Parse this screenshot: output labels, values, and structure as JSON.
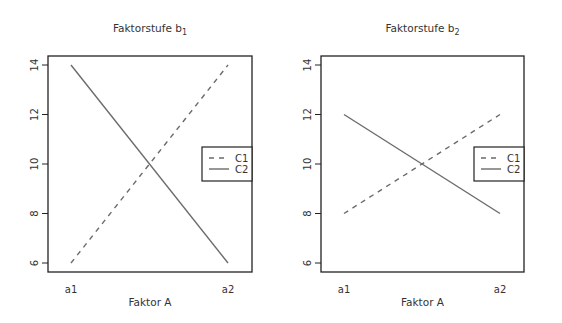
{
  "chart_data": [
    {
      "type": "line",
      "title": "Faktorstufe b",
      "title_subscript": "1",
      "xlabel": "Faktor A",
      "ylabel": "",
      "categories": [
        "a1",
        "a2"
      ],
      "series": [
        {
          "name": "C1",
          "values": [
            6,
            14
          ],
          "style": "dashed"
        },
        {
          "name": "C2",
          "values": [
            14,
            6
          ],
          "style": "solid"
        }
      ],
      "yticks": [
        "6",
        "8",
        "10",
        "12",
        "14"
      ],
      "ylim": [
        6,
        14
      ],
      "grid": false,
      "legend_position": "right"
    },
    {
      "type": "line",
      "title": "Faktorstufe b",
      "title_subscript": "2",
      "xlabel": "Faktor A",
      "ylabel": "",
      "categories": [
        "a1",
        "a2"
      ],
      "series": [
        {
          "name": "C1",
          "values": [
            8,
            12
          ],
          "style": "dashed"
        },
        {
          "name": "C2",
          "values": [
            12,
            8
          ],
          "style": "solid"
        }
      ],
      "yticks": [
        "6",
        "8",
        "10",
        "12",
        "14"
      ],
      "ylim": [
        6,
        14
      ],
      "grid": false,
      "legend_position": "right"
    }
  ],
  "colors": {
    "line": "#6b6b6b",
    "frame": "#222222",
    "text": "#333333"
  }
}
